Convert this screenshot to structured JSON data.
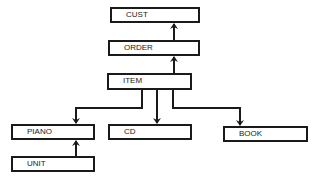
{
  "diagram": {
    "type": "hierarchy",
    "nodes": [
      {
        "id": "cust",
        "label": "CUST",
        "x": 110,
        "y": 7,
        "w": 90,
        "h": 16
      },
      {
        "id": "order",
        "label": "ORDER",
        "x": 108,
        "y": 40,
        "w": 92,
        "h": 16
      },
      {
        "id": "item",
        "label": "ITEM",
        "x": 107,
        "y": 73,
        "w": 85,
        "h": 17
      },
      {
        "id": "piano",
        "label": "PIANO",
        "x": 11,
        "y": 124,
        "w": 84,
        "h": 16
      },
      {
        "id": "cd",
        "label": "CD",
        "x": 108,
        "y": 124,
        "w": 84,
        "h": 16
      },
      {
        "id": "book",
        "label": "BOOK",
        "x": 223,
        "y": 126,
        "w": 85,
        "h": 16
      },
      {
        "id": "unit",
        "label": "UNIT",
        "x": 11,
        "y": 156,
        "w": 84,
        "h": 16
      }
    ],
    "edges": [
      {
        "from": "order",
        "to": "cust"
      },
      {
        "from": "item",
        "to": "order"
      },
      {
        "from": "item",
        "to": "piano"
      },
      {
        "from": "item",
        "to": "cd"
      },
      {
        "from": "item",
        "to": "book"
      },
      {
        "from": "unit",
        "to": "piano"
      }
    ]
  }
}
